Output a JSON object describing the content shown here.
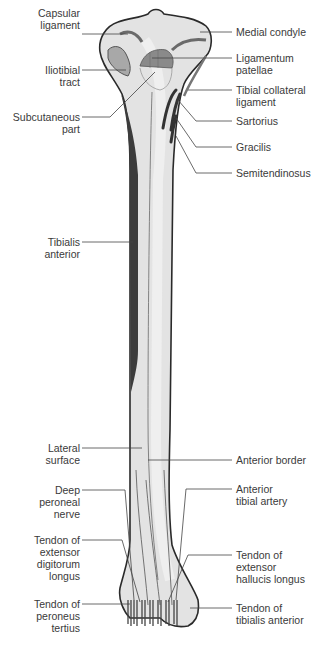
{
  "figure": {
    "colors": {
      "bone_fill": "#e3e3e3",
      "bone_outline": "#2a2a2a",
      "muscle_dark": "#3c3c3c",
      "attachment_fill": "#8a8a8a",
      "leader_line": "#444444",
      "label_text": "#3a3a3a"
    }
  },
  "labels_left": [
    {
      "id": "capsular-ligament",
      "text": "Capsular\nligament"
    },
    {
      "id": "iliotibial-tract",
      "text": "Iliotibial\ntract"
    },
    {
      "id": "subcutaneous-part",
      "text": "Subcutaneous\npart"
    },
    {
      "id": "tibialis-anterior",
      "text": "Tibialis\nanterior"
    },
    {
      "id": "lateral-surface",
      "text": "Lateral\nsurface"
    },
    {
      "id": "deep-peroneal-nerve",
      "text": "Deep\nperoneal\nnerve"
    },
    {
      "id": "tendon-extensor-digitorum-longus",
      "text": "Tendon of\nextensor\ndigitorum\nlongus"
    },
    {
      "id": "tendon-peroneus-tertius",
      "text": "Tendon of\nperoneus\ntertius"
    }
  ],
  "labels_right": [
    {
      "id": "medial-condyle",
      "text": "Medial condyle"
    },
    {
      "id": "ligamentum-patellae",
      "text": "Ligamentum\npatellae"
    },
    {
      "id": "tibial-collateral-ligament",
      "text": "Tibial collateral\nligament"
    },
    {
      "id": "sartorius",
      "text": "Sartorius"
    },
    {
      "id": "gracilis",
      "text": "Gracilis"
    },
    {
      "id": "semitendinosus",
      "text": "Semitendinosus"
    },
    {
      "id": "anterior-border",
      "text": "Anterior border"
    },
    {
      "id": "anterior-tibial-artery",
      "text": "Anterior\ntibial artery"
    },
    {
      "id": "tendon-extensor-hallucis-longus",
      "text": "Tendon of\nextensor\nhallucis longus"
    },
    {
      "id": "tendon-tibialis-anterior",
      "text": "Tendon of\ntibialis anterior"
    }
  ]
}
